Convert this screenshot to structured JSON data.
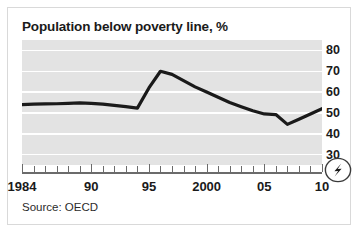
{
  "card": {
    "title": "Population below poverty line, %",
    "source": "Source: OECD",
    "badge_icon": "economist-bolt-badge-icon"
  },
  "chart_data": {
    "type": "line",
    "title": "Population below poverty line, %",
    "subtitle": "",
    "xlabel": "",
    "ylabel": "%",
    "source": "Source: OECD",
    "grid": true,
    "legend": false,
    "xlim": [
      1984,
      2010
    ],
    "ylim": [
      25,
      85
    ],
    "ytick_values": [
      30,
      40,
      50,
      60,
      70,
      80
    ],
    "ytick_labels": [
      "30",
      "40",
      "50",
      "60",
      "70",
      "80"
    ],
    "xtick_values": [
      1984,
      1990,
      1995,
      2000,
      2005,
      2010
    ],
    "xtick_labels": [
      "1984",
      "90",
      "95",
      "2000",
      "05",
      "10"
    ],
    "x": [
      1984,
      1985,
      1986,
      1987,
      1988,
      1989,
      1990,
      1991,
      1992,
      1993,
      1994,
      1995,
      1996,
      1997,
      1998,
      1999,
      2000,
      2001,
      2002,
      2003,
      2004,
      2005,
      2006,
      2007,
      2008,
      2009,
      2010
    ],
    "series": [
      {
        "name": "Population below poverty line, %",
        "color": "#1a1a1a",
        "values": [
          54.0,
          54.2,
          54.3,
          54.4,
          54.6,
          54.8,
          54.6,
          54.2,
          53.6,
          53.0,
          52.3,
          62.0,
          70.0,
          68.5,
          65.5,
          62.5,
          60.0,
          57.5,
          55.0,
          53.0,
          51.0,
          49.5,
          49.2,
          44.5,
          47.0,
          49.5,
          52.0
        ]
      }
    ]
  },
  "axis": {
    "minor_tick_years": [
      1985,
      1986,
      1987,
      1988,
      1989,
      1991,
      1992,
      1993,
      1994,
      1996,
      1997,
      1998,
      1999,
      2001,
      2002,
      2003,
      2004,
      2006,
      2007,
      2008,
      2009
    ],
    "major_tick_years": [
      1984,
      1990,
      1995,
      2000,
      2005,
      2010
    ]
  }
}
